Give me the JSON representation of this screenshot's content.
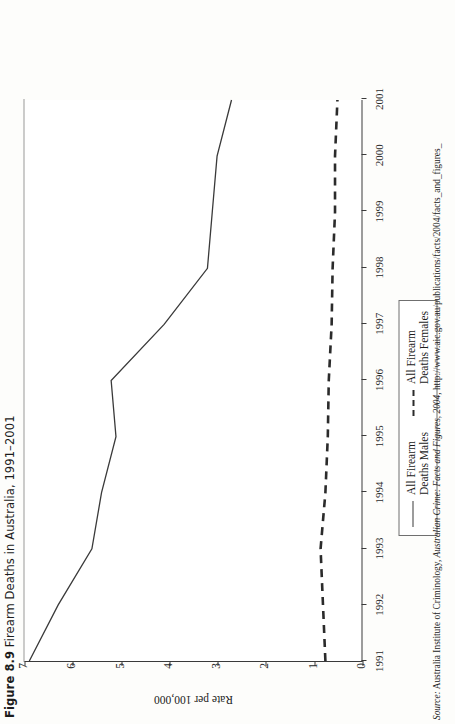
{
  "figure": {
    "number": "Figure 8.9",
    "caption": "Firearm Deaths in Australia, 1991–2001"
  },
  "axes": {
    "ylabel": "Rate per 100,000",
    "xlabel": "",
    "yticks": [
      "0",
      "1",
      "2",
      "3",
      "4",
      "5",
      "6",
      "7"
    ],
    "xticks": [
      "1991",
      "1992",
      "1993",
      "1994",
      "1995",
      "1996",
      "1997",
      "1998",
      "1999",
      "2000",
      "2001"
    ]
  },
  "legend": {
    "items": [
      {
        "label_line1": "All Firearm",
        "label_line2": "Deaths Males",
        "style": "solid"
      },
      {
        "label_line1": "All Firearm",
        "label_line2": "Deaths Females",
        "style": "dashed"
      }
    ]
  },
  "source": {
    "label": "Source:",
    "text": " Australia Institute of Criminology, ",
    "title": "Australian Crime: Facts and Figures, 2004",
    "text2": ", http://www.aic.gov.au/publications/facts/2004/facts_and_figures_"
  },
  "chart_data": {
    "type": "line",
    "title": "Firearm Deaths in Australia, 1991–2001",
    "xlabel": "",
    "ylabel": "Rate per 100,000",
    "x": [
      1991,
      1992,
      1993,
      1994,
      1995,
      1996,
      1997,
      1998,
      1999,
      2000,
      2001
    ],
    "xlim": [
      1991,
      2001
    ],
    "ylim": [
      0,
      7
    ],
    "grid": false,
    "legend_position": "bottom-right",
    "series": [
      {
        "name": "All Firearm Deaths Males",
        "style": "solid",
        "color": "#3a3a3a",
        "values": [
          6.9,
          6.3,
          5.6,
          5.4,
          5.1,
          5.2,
          4.1,
          3.2,
          3.1,
          3.0,
          2.7
        ]
      },
      {
        "name": "All Firearm Deaths Females",
        "style": "dashed",
        "color": "#2b2b2b",
        "values": [
          0.75,
          0.8,
          0.85,
          0.75,
          0.7,
          0.68,
          0.62,
          0.6,
          0.55,
          0.55,
          0.5
        ]
      }
    ]
  }
}
